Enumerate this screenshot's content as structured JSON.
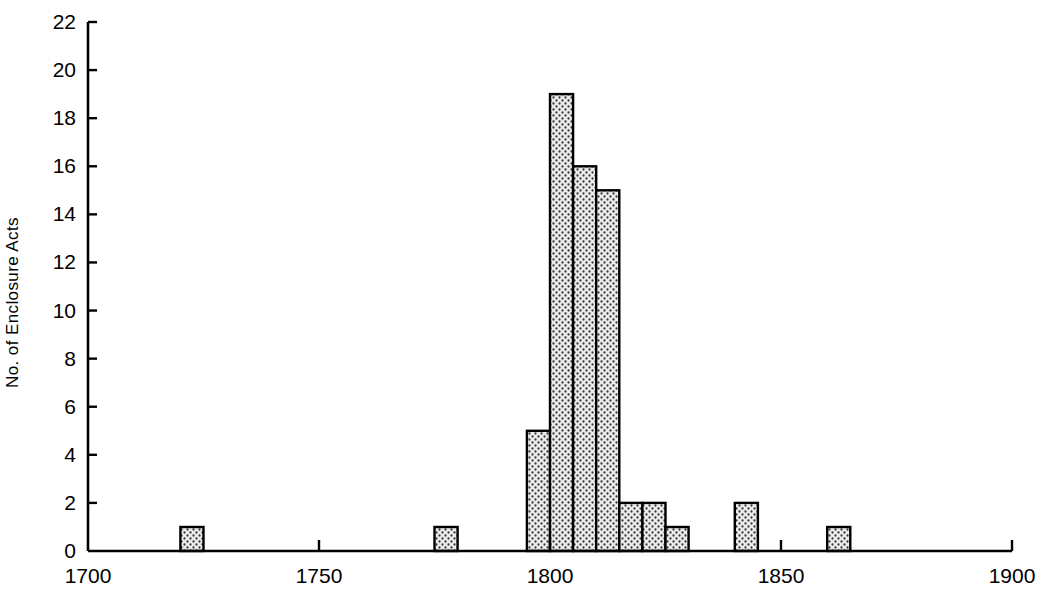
{
  "chart_data": {
    "type": "bar",
    "title": "",
    "subtitle": "",
    "xlabel": "",
    "ylabel": "No. of Enclosure Acts",
    "xlim": [
      1700,
      1900
    ],
    "ylim": [
      0,
      22
    ],
    "grid": false,
    "legend": null,
    "bar_width_years": 5,
    "x_tick_labels": [
      "1700",
      "1750",
      "1800",
      "1850",
      "1900"
    ],
    "x_ticks": [
      1700,
      1750,
      1800,
      1850,
      1900
    ],
    "y_tick_labels": [
      "0",
      "2",
      "4",
      "6",
      "8",
      "10",
      "12",
      "14",
      "16",
      "18",
      "20",
      "22"
    ],
    "y_ticks": [
      0,
      2,
      4,
      6,
      8,
      10,
      12,
      14,
      16,
      18,
      20,
      22
    ],
    "bin_starts": [
      1720,
      1775,
      1795,
      1800,
      1805,
      1810,
      1815,
      1820,
      1825,
      1840,
      1860
    ],
    "categories": [
      "1720-1725",
      "1775-1780",
      "1795-1800",
      "1800-1805",
      "1805-1810",
      "1810-1815",
      "1815-1820",
      "1820-1825",
      "1825-1830",
      "1840-1845",
      "1860-1865"
    ],
    "values": [
      1,
      1,
      5,
      19,
      16,
      15,
      2,
      2,
      1,
      2,
      1
    ],
    "bar_fill": "#e8e8e8",
    "bar_edge": "#000000",
    "bar_pattern": "dotted-stipple",
    "axis_color": "#000000",
    "background": "#ffffff"
  }
}
